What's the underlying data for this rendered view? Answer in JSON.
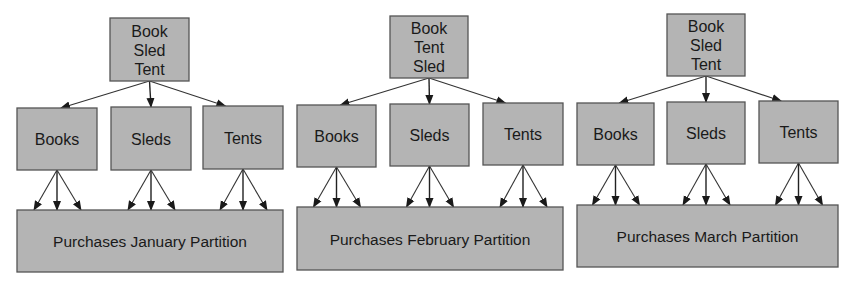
{
  "colors": {
    "box_fill": "#b4b4b4",
    "box_border": "#555555",
    "arrow": "#333333",
    "text": "#1a1a1a",
    "background": "#ffffff"
  },
  "diagrams": [
    {
      "id": "january",
      "root": {
        "lines": [
          "Book",
          "Sled",
          "Tent"
        ],
        "x": 110,
        "y": 18,
        "w": 79,
        "h": 63
      },
      "children": [
        {
          "label": "Books",
          "x": 17,
          "y": 108,
          "w": 80,
          "h": 62
        },
        {
          "label": "Sleds",
          "x": 111,
          "y": 107,
          "w": 80,
          "h": 63
        },
        {
          "label": "Tents",
          "x": 203,
          "y": 106,
          "w": 80,
          "h": 63
        }
      ],
      "partition": {
        "label": "Purchases January Partition",
        "x": 17,
        "y": 210,
        "w": 266,
        "h": 62
      }
    },
    {
      "id": "february",
      "root": {
        "lines": [
          "Book",
          "Tent",
          "Sled"
        ],
        "x": 390,
        "y": 16,
        "w": 78,
        "h": 62
      },
      "children": [
        {
          "label": "Books",
          "x": 297,
          "y": 105,
          "w": 79,
          "h": 62
        },
        {
          "label": "Sleds",
          "x": 390,
          "y": 104,
          "w": 79,
          "h": 62
        },
        {
          "label": "Tents",
          "x": 483,
          "y": 103,
          "w": 80,
          "h": 62
        }
      ],
      "partition": {
        "label": "Purchases February Partition",
        "x": 297,
        "y": 207,
        "w": 266,
        "h": 63
      }
    },
    {
      "id": "march",
      "root": {
        "lines": [
          "Book",
          "Sled",
          "Tent"
        ],
        "x": 667,
        "y": 14,
        "w": 78,
        "h": 62
      },
      "children": [
        {
          "label": "Books",
          "x": 577,
          "y": 103,
          "w": 77,
          "h": 62
        },
        {
          "label": "Sleds",
          "x": 667,
          "y": 102,
          "w": 78,
          "h": 62
        },
        {
          "label": "Tents",
          "x": 759,
          "y": 101,
          "w": 79,
          "h": 62
        }
      ],
      "partition": {
        "label": "Purchases March Partition",
        "x": 577,
        "y": 205,
        "w": 261,
        "h": 62
      }
    }
  ]
}
